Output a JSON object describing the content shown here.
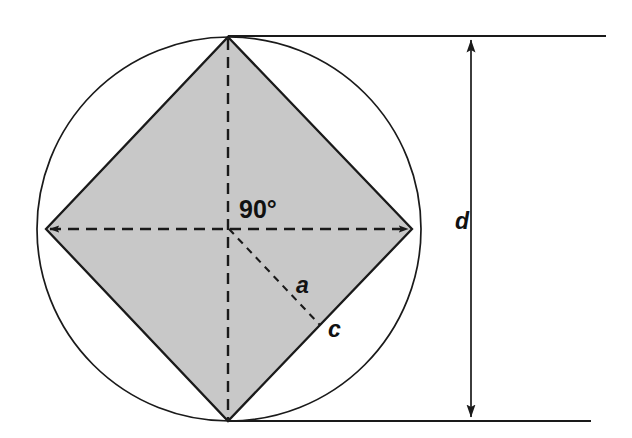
{
  "figure": {
    "type": "geometry-diagram",
    "background_color": "#ffffff",
    "stroke_color": "#1a1a1a",
    "fill_color": "#c8c8c8"
  },
  "labels": {
    "angle": "90°",
    "apothem": "a",
    "side": "c",
    "diameter": "d"
  },
  "geometry": {
    "circle": {
      "name": "circumscribed-circle",
      "center_x": 229,
      "center_y": 229,
      "radius": 192,
      "fill": "#ffffff",
      "stroke": "#1a1a1a",
      "stroke_width": 1.6
    },
    "square": {
      "name": "inscribed-square",
      "points": "228,37 412,229 228,421 46,229",
      "fill": "#c8c8c8",
      "stroke": "#1a1a1a",
      "stroke_width": 2.2,
      "rotation_deg": 45
    },
    "diagonal_horizontal": {
      "name": "horizontal-diagonal",
      "x1": 46,
      "y1": 229,
      "x2": 412,
      "y2": 229,
      "dash": "11 7",
      "arrowheads": "both"
    },
    "diagonal_vertical": {
      "name": "vertical-diagonal",
      "x1": 228,
      "y1": 37,
      "x2": 228,
      "y2": 421,
      "dash": "11 7",
      "arrowheads": "none"
    },
    "apothem_line": {
      "name": "apothem-line",
      "x1": 229,
      "y1": 229,
      "x2": 320,
      "y2": 325,
      "dash": "7 6"
    },
    "extension_line_top": {
      "name": "extension-line-top",
      "x1": 228,
      "y1": 36,
      "x2": 606,
      "y2": 36
    },
    "extension_line_bottom": {
      "name": "extension-line-bottom",
      "x1": 228,
      "y1": 421,
      "x2": 591,
      "y2": 421
    },
    "dimension_arrow": {
      "name": "diameter-dimension-arrow",
      "x": 471,
      "y1": 36,
      "y2": 421,
      "arrowheads": "both"
    }
  },
  "label_positions": {
    "angle": {
      "left": 239,
      "top": 197
    },
    "apothem": {
      "left": 296,
      "top": 274
    },
    "side": {
      "left": 328,
      "top": 318
    },
    "diameter": {
      "left": 455,
      "top": 210
    }
  }
}
